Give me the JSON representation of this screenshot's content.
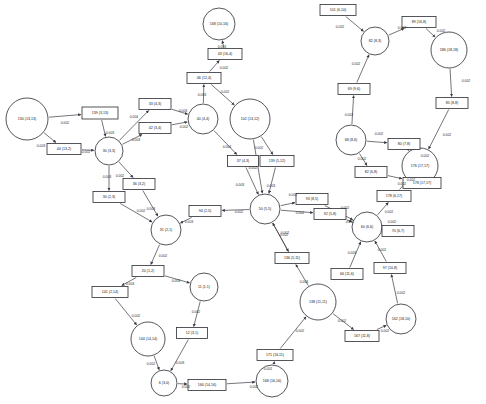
{
  "chart_data": {
    "type": "diagram",
    "subtype": "directed-network-graph",
    "title": "",
    "background": "#ffffff",
    "node_stroke": "#2b2b33",
    "edge_stroke": "#3a3a44",
    "label_color": "#15151a",
    "node_label_format": "ID (x,y)",
    "edge_label_format": "0.00N",
    "nodes": [
      {
        "id": "n130",
        "label": "130 (13,13)",
        "shape": "circle",
        "x": 27,
        "y": 119,
        "r": 21,
        "fontsize": 3.6
      },
      {
        "id": "n139",
        "label": "139 (3,13)",
        "shape": "rect",
        "x": 100,
        "y": 113,
        "w": 36,
        "h": 12,
        "fontsize": 3.6
      },
      {
        "id": "n44",
        "label": "44 (13,2)",
        "shape": "rect",
        "x": 64,
        "y": 149,
        "w": 34,
        "h": 11,
        "fontsize": 3.6
      },
      {
        "id": "n30",
        "label": "30 (3,3)",
        "shape": "circle",
        "x": 109,
        "y": 151,
        "r": 14,
        "fontsize": 3.6
      },
      {
        "id": "n33",
        "label": "33 (4,3)",
        "shape": "rect",
        "x": 155,
        "y": 104,
        "w": 32,
        "h": 11,
        "fontsize": 3.6
      },
      {
        "id": "n42",
        "label": "42 (3,4)",
        "shape": "rect",
        "x": 155,
        "y": 128,
        "w": 32,
        "h": 11,
        "fontsize": 3.6
      },
      {
        "id": "n40",
        "label": "40 (4,4)",
        "shape": "circle",
        "x": 203,
        "y": 119,
        "r": 15,
        "fontsize": 3.6
      },
      {
        "id": "n46",
        "label": "46 (12,4)",
        "shape": "rect",
        "x": 204,
        "y": 78,
        "w": 34,
        "h": 11,
        "fontsize": 3.6
      },
      {
        "id": "n43",
        "label": "43 (16,4)",
        "shape": "rect",
        "x": 225,
        "y": 54,
        "w": 34,
        "h": 11,
        "fontsize": 3.6
      },
      {
        "id": "n168",
        "label": "168 (10,16)",
        "shape": "circle",
        "x": 219,
        "y": 24,
        "r": 16,
        "fontsize": 3.6
      },
      {
        "id": "n102",
        "label": "102 (13,12)",
        "shape": "circle",
        "x": 250,
        "y": 119,
        "r": 20,
        "fontsize": 3.6
      },
      {
        "id": "n37",
        "label": "37 (4,3)",
        "shape": "rect",
        "x": 243,
        "y": 161,
        "w": 31,
        "h": 11,
        "fontsize": 3.6
      },
      {
        "id": "n139b",
        "label": "139 (5,12)",
        "shape": "rect",
        "x": 277,
        "y": 161,
        "w": 34,
        "h": 11,
        "fontsize": 3.6
      },
      {
        "id": "n50",
        "label": "50 (5,5)",
        "shape": "circle",
        "x": 265,
        "y": 209,
        "r": 15,
        "fontsize": 3.6
      },
      {
        "id": "n94",
        "label": "94 (2,5)",
        "shape": "rect",
        "x": 205,
        "y": 211,
        "w": 32,
        "h": 11,
        "fontsize": 3.6
      },
      {
        "id": "n31",
        "label": "31 (2,1)",
        "shape": "circle",
        "x": 166,
        "y": 230,
        "r": 15,
        "fontsize": 3.6
      },
      {
        "id": "n30b",
        "label": "30 (2,3)",
        "shape": "rect",
        "x": 109,
        "y": 197,
        "w": 32,
        "h": 11,
        "fontsize": 3.6
      },
      {
        "id": "n36",
        "label": "36 (3,2)",
        "shape": "rect",
        "x": 139,
        "y": 184,
        "w": 32,
        "h": 11,
        "fontsize": 3.6
      },
      {
        "id": "n20",
        "label": "20 (1,2)",
        "shape": "rect",
        "x": 148,
        "y": 271,
        "w": 32,
        "h": 11,
        "fontsize": 3.6
      },
      {
        "id": "n141",
        "label": "141 (2,14)",
        "shape": "rect",
        "x": 110,
        "y": 292,
        "w": 36,
        "h": 11,
        "fontsize": 3.6
      },
      {
        "id": "n144",
        "label": "144 (14,14)",
        "shape": "circle",
        "x": 148,
        "y": 339,
        "r": 17,
        "fontsize": 3.6
      },
      {
        "id": "n11",
        "label": "11 (1,1)",
        "shape": "circle",
        "x": 204,
        "y": 287,
        "r": 14,
        "fontsize": 3.6
      },
      {
        "id": "n12",
        "label": "12 (3,1)",
        "shape": "rect",
        "x": 192,
        "y": 333,
        "w": 31,
        "h": 11,
        "fontsize": 3.6
      },
      {
        "id": "n6",
        "label": "6 (3,0)",
        "shape": "circle",
        "x": 164,
        "y": 383,
        "r": 13,
        "fontsize": 3.6
      },
      {
        "id": "n166",
        "label": "166 (14,16)",
        "shape": "rect",
        "x": 207,
        "y": 385,
        "w": 38,
        "h": 11,
        "fontsize": 3.6
      },
      {
        "id": "n168b",
        "label": "168 (16,16)",
        "shape": "circle",
        "x": 272,
        "y": 381,
        "r": 16,
        "fontsize": 3.6
      },
      {
        "id": "n171",
        "label": "171 (16,11)",
        "shape": "rect",
        "x": 275,
        "y": 355,
        "w": 36,
        "h": 11,
        "fontsize": 3.6
      },
      {
        "id": "n138",
        "label": "138 (11,11)",
        "shape": "circle",
        "x": 318,
        "y": 302,
        "r": 18,
        "fontsize": 3.6
      },
      {
        "id": "n136",
        "label": "136 (5,11)",
        "shape": "rect",
        "x": 292,
        "y": 258,
        "w": 34,
        "h": 11,
        "fontsize": 3.6
      },
      {
        "id": "n167",
        "label": "167 (11,8)",
        "shape": "rect",
        "x": 362,
        "y": 336,
        "w": 34,
        "h": 11,
        "fontsize": 3.6
      },
      {
        "id": "n162",
        "label": "162 (18,10)",
        "shape": "circle",
        "x": 401,
        "y": 319,
        "r": 15,
        "fontsize": 3.6
      },
      {
        "id": "n97",
        "label": "97 (10,8)",
        "shape": "rect",
        "x": 390,
        "y": 268,
        "w": 32,
        "h": 11,
        "fontsize": 3.6
      },
      {
        "id": "n66",
        "label": "66 (11,6)",
        "shape": "rect",
        "x": 347,
        "y": 274,
        "w": 32,
        "h": 11,
        "fontsize": 3.6
      },
      {
        "id": "n60",
        "label": "60 (6,6)",
        "shape": "circle",
        "x": 367,
        "y": 227,
        "r": 15,
        "fontsize": 3.6
      },
      {
        "id": "n70",
        "label": "70 (6,7)",
        "shape": "rect",
        "x": 398,
        "y": 231,
        "w": 32,
        "h": 11,
        "fontsize": 3.6
      },
      {
        "id": "n178",
        "label": "178 (6,17)",
        "shape": "rect",
        "x": 394,
        "y": 196,
        "w": 34,
        "h": 11,
        "fontsize": 3.6
      },
      {
        "id": "n176",
        "label": "176 (17,17)",
        "shape": "circle",
        "x": 420,
        "y": 166,
        "r": 18,
        "fontsize": 3.6
      },
      {
        "id": "n178b",
        "label": "178 (17,17)",
        "shape": "rect",
        "x": 422,
        "y": 183,
        "w": 38,
        "h": 11,
        "fontsize": 3.6
      },
      {
        "id": "n93",
        "label": "93 (8,5)",
        "shape": "rect",
        "x": 312,
        "y": 199,
        "w": 32,
        "h": 11,
        "fontsize": 3.6
      },
      {
        "id": "n92",
        "label": "92 (5,8)",
        "shape": "rect",
        "x": 330,
        "y": 214,
        "w": 32,
        "h": 11,
        "fontsize": 3.6
      },
      {
        "id": "n82",
        "label": "82 (6,8)",
        "shape": "rect",
        "x": 371,
        "y": 172,
        "w": 32,
        "h": 11,
        "fontsize": 3.6
      },
      {
        "id": "n80",
        "label": "80 (7,8)",
        "shape": "rect",
        "x": 404,
        "y": 144,
        "w": 32,
        "h": 11,
        "fontsize": 3.6
      },
      {
        "id": "n68",
        "label": "68 (8,6)",
        "shape": "circle",
        "x": 351,
        "y": 140,
        "r": 15,
        "fontsize": 3.6
      },
      {
        "id": "n69",
        "label": "69 (9,6)",
        "shape": "rect",
        "x": 354,
        "y": 89,
        "w": 32,
        "h": 11,
        "fontsize": 3.6
      },
      {
        "id": "n82b",
        "label": "82 (8,3)",
        "shape": "circle",
        "x": 375,
        "y": 41,
        "r": 14,
        "fontsize": 3.6
      },
      {
        "id": "n101",
        "label": "101 (6,10)",
        "shape": "rect",
        "x": 338,
        "y": 10,
        "w": 36,
        "h": 11,
        "fontsize": 3.6
      },
      {
        "id": "n89",
        "label": "89 (16,8)",
        "shape": "rect",
        "x": 419,
        "y": 22,
        "w": 34,
        "h": 11,
        "fontsize": 3.6
      },
      {
        "id": "n186",
        "label": "186 (18,18)",
        "shape": "circle",
        "x": 449,
        "y": 50,
        "r": 18,
        "fontsize": 3.6
      },
      {
        "id": "n85",
        "label": "85 (8,8)",
        "shape": "rect",
        "x": 452,
        "y": 103,
        "w": 32,
        "h": 11,
        "fontsize": 3.6
      }
    ],
    "edges": [
      {
        "from": "n130",
        "to": "n139",
        "weight": "0.002",
        "lx": 65,
        "ly": 123
      },
      {
        "from": "n130",
        "to": "n44",
        "weight": "0.003",
        "lx": 41,
        "ly": 146
      },
      {
        "from": "n44",
        "to": "n30",
        "weight": "0.002",
        "lx": 86,
        "ly": 152
      },
      {
        "from": "n139",
        "to": "n30",
        "weight": "0.003",
        "lx": 110,
        "ly": 133
      },
      {
        "from": "n30",
        "to": "n33",
        "weight": "0.004",
        "lx": 134,
        "ly": 117
      },
      {
        "from": "n30",
        "to": "n42",
        "weight": "0.003",
        "lx": 136,
        "ly": 140
      },
      {
        "from": "n33",
        "to": "n40",
        "weight": "0.003",
        "lx": 183,
        "ly": 111
      },
      {
        "from": "n42",
        "to": "n40",
        "weight": "0.002",
        "lx": 184,
        "ly": 127
      },
      {
        "from": "n40",
        "to": "n46",
        "weight": "0.003",
        "lx": 202,
        "ly": 95
      },
      {
        "from": "n46",
        "to": "n43",
        "weight": "0.002",
        "lx": 224,
        "ly": 68
      },
      {
        "from": "n43",
        "to": "n168",
        "weight": "0.003",
        "lx": 222,
        "ly": 47
      },
      {
        "from": "n46",
        "to": "n102",
        "weight": "0.002",
        "lx": 225,
        "ly": 92
      },
      {
        "from": "n40",
        "to": "n37",
        "weight": "0.004",
        "lx": 227,
        "ly": 147
      },
      {
        "from": "n102",
        "to": "n139b",
        "weight": "0.002",
        "lx": 259,
        "ly": 148
      },
      {
        "from": "n37",
        "to": "n50",
        "weight": "0.003",
        "lx": 240,
        "ly": 185
      },
      {
        "from": "n139b",
        "to": "n50",
        "weight": "0.003",
        "lx": 271,
        "ly": 186
      },
      {
        "from": "n50",
        "to": "n94",
        "weight": "0.002",
        "lx": 239,
        "ly": 212
      },
      {
        "from": "n94",
        "to": "n31",
        "weight": "0.003",
        "lx": 189,
        "ly": 222
      },
      {
        "from": "n30",
        "to": "n36",
        "weight": "0.002",
        "lx": 120,
        "ly": 176
      },
      {
        "from": "n30",
        "to": "n30b",
        "weight": "0.003",
        "lx": 107,
        "ly": 177
      },
      {
        "from": "n36",
        "to": "n31",
        "weight": "0.003",
        "lx": 151,
        "ly": 209
      },
      {
        "from": "n30b",
        "to": "n31",
        "weight": "0.002",
        "lx": 141,
        "ly": 211
      },
      {
        "from": "n31",
        "to": "n20",
        "weight": "0.002",
        "lx": 163,
        "ly": 256
      },
      {
        "from": "n20",
        "to": "n141",
        "weight": "0.003",
        "lx": 130,
        "ly": 284
      },
      {
        "from": "n141",
        "to": "n144",
        "weight": "0.002",
        "lx": 136,
        "ly": 316
      },
      {
        "from": "n20",
        "to": "n11",
        "weight": "0.003",
        "lx": 176,
        "ly": 281
      },
      {
        "from": "n11",
        "to": "n12",
        "weight": "0.002",
        "lx": 196,
        "ly": 312
      },
      {
        "from": "n12",
        "to": "n6",
        "weight": "0.003",
        "lx": 180,
        "ly": 363
      },
      {
        "from": "n144",
        "to": "n6",
        "weight": "0.002",
        "lx": 151,
        "ly": 364
      },
      {
        "from": "n6",
        "to": "n166",
        "weight": "0.002",
        "lx": 186,
        "ly": 387
      },
      {
        "from": "n166",
        "to": "n168b",
        "weight": "0.002",
        "lx": 254,
        "ly": 387
      },
      {
        "from": "n168b",
        "to": "n171",
        "weight": "0.002",
        "lx": 268,
        "ly": 369
      },
      {
        "from": "n171",
        "to": "n138",
        "weight": "0.002",
        "lx": 300,
        "ly": 331
      },
      {
        "from": "n138",
        "to": "n136",
        "weight": "0.003",
        "lx": 304,
        "ly": 282
      },
      {
        "from": "n136",
        "to": "n50",
        "weight": "0.002",
        "lx": 285,
        "ly": 233
      },
      {
        "from": "n138",
        "to": "n167",
        "weight": "0.002",
        "lx": 342,
        "ly": 321
      },
      {
        "from": "n167",
        "to": "n162",
        "weight": "0.002",
        "lx": 385,
        "ly": 331
      },
      {
        "from": "n162",
        "to": "n97",
        "weight": "0.002",
        "lx": 401,
        "ly": 293
      },
      {
        "from": "n97",
        "to": "n60",
        "weight": "0.002",
        "lx": 382,
        "ly": 250
      },
      {
        "from": "n66",
        "to": "n60",
        "weight": "0.003",
        "lx": 352,
        "ly": 253
      },
      {
        "from": "n50",
        "to": "n92",
        "weight": "0.002",
        "lx": 300,
        "ly": 213
      },
      {
        "from": "n92",
        "to": "n60",
        "weight": "0.002",
        "lx": 350,
        "ly": 222
      },
      {
        "from": "n50",
        "to": "n93",
        "weight": "0.002",
        "lx": 293,
        "ly": 195
      },
      {
        "from": "n93",
        "to": "n60",
        "weight": "0.002",
        "lx": 345,
        "ly": 208
      },
      {
        "from": "n60",
        "to": "n70",
        "weight": "0.002",
        "lx": 392,
        "ly": 222
      },
      {
        "from": "n60",
        "to": "n178",
        "weight": "0.002",
        "lx": 389,
        "ly": 212
      },
      {
        "from": "n178",
        "to": "n176",
        "weight": "0.002",
        "lx": 402,
        "ly": 184
      },
      {
        "from": "n82",
        "to": "n178b",
        "weight": "0.002",
        "lx": 411,
        "ly": 180
      },
      {
        "from": "n68",
        "to": "n82",
        "weight": "0.002",
        "lx": 362,
        "ly": 159
      },
      {
        "from": "n68",
        "to": "n80",
        "weight": "0.002",
        "lx": 379,
        "ly": 134
      },
      {
        "from": "n80",
        "to": "n176",
        "weight": "0.002",
        "lx": 425,
        "ly": 156
      },
      {
        "from": "n68",
        "to": "n69",
        "weight": "0.002",
        "lx": 349,
        "ly": 115
      },
      {
        "from": "n69",
        "to": "n82b",
        "weight": "0.002",
        "lx": 356,
        "ly": 64
      },
      {
        "from": "n101",
        "to": "n82b",
        "weight": "0.002",
        "lx": 340,
        "ly": 27
      },
      {
        "from": "n82b",
        "to": "n89",
        "weight": "0.002",
        "lx": 402,
        "ly": 28
      },
      {
        "from": "n89",
        "to": "n186",
        "weight": "0.002",
        "lx": 441,
        "ly": 31
      },
      {
        "from": "n186",
        "to": "n85",
        "weight": "0.002",
        "lx": 466,
        "ly": 81
      },
      {
        "from": "n85",
        "to": "n176",
        "weight": "0.002",
        "lx": 447,
        "ly": 135
      },
      {
        "from": "n102",
        "to": "n50",
        "weight": "0.002",
        "lx": 253,
        "ly": 168
      },
      {
        "from": "n50",
        "to": "n136",
        "weight": "0.002",
        "lx": 284,
        "ly": 235
      }
    ]
  }
}
